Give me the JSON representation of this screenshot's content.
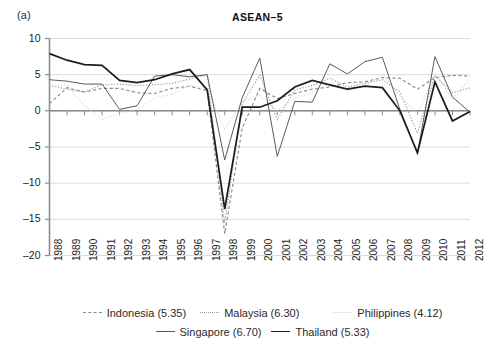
{
  "figure": {
    "panel_label": "(a)",
    "title": "ASEAN–5"
  },
  "axes": {
    "y_ticks": [
      "10",
      "5",
      "0",
      "-5",
      "-10",
      "-15",
      "-20"
    ],
    "x_ticks": [
      "1988",
      "1989",
      "1990",
      "1991",
      "1992",
      "1993",
      "1994",
      "1995",
      "1996",
      "1997",
      "1998",
      "1999",
      "2000",
      "2001",
      "2002",
      "2003",
      "2004",
      "2005",
      "2006",
      "2007",
      "2008",
      "2009",
      "2010",
      "2011",
      "2012"
    ]
  },
  "legend": {
    "items": [
      {
        "label": "Indonesia (5.35)",
        "icon": "dashed-line-icon",
        "swatch": "sw-indonesia"
      },
      {
        "label": "Malaysia (6.30)",
        "icon": "dotted-line-icon",
        "swatch": "sw-malaysia"
      },
      {
        "label": "Philippines (4.12)",
        "icon": "faint-dotted-line-icon",
        "swatch": "sw-philippines"
      },
      {
        "label": "Singapore (6.70)",
        "icon": "thin-solid-line-icon",
        "swatch": "sw-singapore"
      },
      {
        "label": "Thailand (5.33)",
        "icon": "thick-solid-line-icon",
        "swatch": "sw-thailand"
      }
    ]
  },
  "colors": {
    "indonesia": "#8a8a8a",
    "malaysia": "#9a9a9a",
    "philippines": "#d6d6d6",
    "singapore": "#5a5a5a",
    "thailand": "#1d1d1d",
    "grid": "#d8d8d8",
    "axis": "#8c8c8c"
  },
  "chart_data": {
    "type": "line",
    "title": "ASEAN–5",
    "xlabel": "",
    "ylabel": "",
    "ylim": [
      -20,
      10
    ],
    "xlim": [
      "1988",
      "2012"
    ],
    "grid": true,
    "legend_position": "bottom",
    "x": [
      1988,
      1989,
      1990,
      1991,
      1992,
      1993,
      1994,
      1995,
      1996,
      1997,
      1998,
      1999,
      2000,
      2001,
      2002,
      2003,
      2004,
      2005,
      2006,
      2007,
      2008,
      2009,
      2010,
      2011,
      2012
    ],
    "series": [
      {
        "name": "Indonesia (5.35)",
        "mean": 5.35,
        "style": "dashed",
        "values": [
          1.0,
          3.2,
          2.6,
          3.1,
          3.1,
          2.5,
          2.4,
          3.1,
          3.4,
          2.8,
          -17.0,
          -2.4,
          3.1,
          1.7,
          2.4,
          3.0,
          3.3,
          3.9,
          4.0,
          4.6,
          4.5,
          3.0,
          4.6,
          4.9,
          4.8
        ],
        "annotation": "deepest 1998 trough (–17)"
      },
      {
        "name": "Malaysia (6.30)",
        "mean": 6.3,
        "style": "dotted",
        "values": [
          3.5,
          3.0,
          2.6,
          3.6,
          3.7,
          3.5,
          3.6,
          3.8,
          4.4,
          5.0,
          -15.5,
          1.0,
          4.9,
          -1.2,
          2.9,
          3.5,
          4.5,
          3.3,
          3.8,
          4.3,
          2.6,
          -3.1,
          4.9,
          2.5,
          3.2
        ],
        "annotation": "1998 trough –15.5"
      },
      {
        "name": "Philippines (4.12)",
        "mean": 4.12,
        "style": "faint-dotted",
        "values": [
          3.6,
          3.5,
          0.7,
          -1.2,
          -0.4,
          0.2,
          1.8,
          2.3,
          3.5,
          3.2,
          -2.6,
          1.3,
          2.1,
          0.0,
          1.7,
          2.6,
          3.9,
          2.8,
          3.4,
          5.0,
          2.1,
          -0.5,
          5.2,
          1.6,
          4.5
        ],
        "annotation": "milder 1998 decline"
      },
      {
        "name": "Singapore (6.70)",
        "mean": 6.7,
        "style": "thin-solid",
        "values": [
          4.3,
          4.1,
          3.7,
          3.7,
          0.2,
          0.7,
          4.8,
          5.0,
          4.7,
          5.0,
          -6.8,
          1.8,
          7.3,
          -6.3,
          1.3,
          1.2,
          6.5,
          5.1,
          6.8,
          7.4,
          0.2,
          -5.9,
          7.5,
          1.9,
          -0.2
        ],
        "annotation": "highest 2010 peak (7.5)"
      },
      {
        "name": "Thailand (5.33)",
        "mean": 5.33,
        "style": "thick-solid",
        "values": [
          7.9,
          7.0,
          6.4,
          6.3,
          4.2,
          3.9,
          4.3,
          5.1,
          5.7,
          2.9,
          -13.6,
          0.5,
          0.5,
          1.4,
          3.3,
          4.2,
          3.6,
          3.0,
          3.4,
          3.2,
          0.0,
          -5.8,
          4.0,
          -1.4,
          -0.1
        ],
        "annotation": "starts highest at 7.9 in 1988"
      }
    ]
  }
}
